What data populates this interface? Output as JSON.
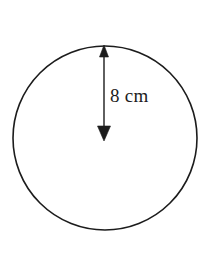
{
  "figure": {
    "type": "geometry-diagram",
    "background_color": "#ffffff",
    "stroke_color": "#1c1c1c",
    "text_color": "#1c1c1c",
    "circle": {
      "center_x": 105,
      "center_y": 138,
      "radius_px": 92,
      "stroke_width": 1.6,
      "fill": "none"
    },
    "dimension_arrow": {
      "orientation": "vertical",
      "double_headed": true,
      "x": 104,
      "y_top": 46,
      "y_bottom": 138,
      "stroke_width": 1.4,
      "arrowhead_top": "filled-triangle-up",
      "arrowhead_bottom": "filled-triangle-down"
    },
    "label": {
      "text": "8 cm",
      "value": 8,
      "unit": "cm",
      "measures": "radius",
      "x": 110,
      "y": 85,
      "font_size_px": 19
    }
  }
}
